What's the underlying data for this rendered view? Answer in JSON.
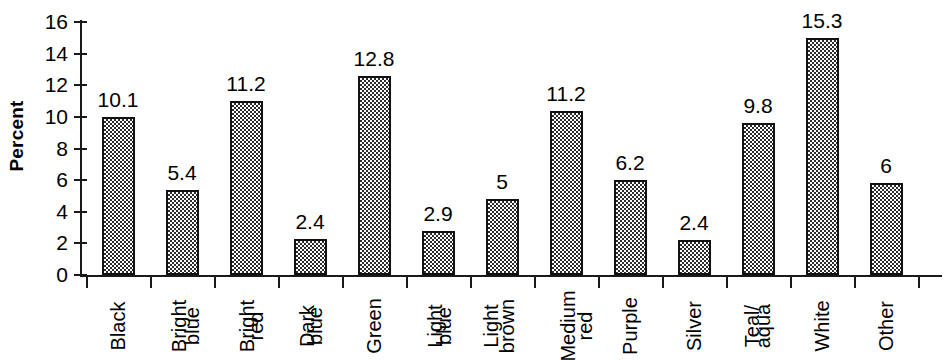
{
  "chart_data": {
    "type": "bar",
    "title": "",
    "xlabel": "",
    "ylabel": "Percent",
    "ylim": [
      0,
      16
    ],
    "ytick_step": 2,
    "yticks": [
      16,
      14,
      12,
      10,
      8,
      6,
      4,
      2,
      0
    ],
    "grid": false,
    "legend": "none",
    "orientation": "vertical",
    "bar_fill": "checkerboard-hatch",
    "bar_outline_color": "#111111",
    "categories": [
      "Black",
      "Bright blue",
      "Bright red",
      "Dark blue",
      "Green",
      "Light blue",
      "Light brown",
      "Medium red",
      "Purple",
      "Silver",
      "Teal/ aqua",
      "White",
      "Other"
    ],
    "category_label_lines": [
      [
        "Black"
      ],
      [
        "Bright",
        "blue"
      ],
      [
        "Bright",
        "red"
      ],
      [
        "Dark",
        "blue"
      ],
      [
        "Green"
      ],
      [
        "Light",
        "blue"
      ],
      [
        "Light",
        "brown"
      ],
      [
        "Medium",
        "red"
      ],
      [
        "Purple"
      ],
      [
        "Silver"
      ],
      [
        "Teal/",
        "aqua"
      ],
      [
        "White"
      ],
      [
        "Other"
      ]
    ],
    "values": [
      10.1,
      5.4,
      11.2,
      2.4,
      12.8,
      2.9,
      5,
      11.2,
      6.2,
      2.4,
      9.8,
      15.3,
      6
    ],
    "value_labels": [
      "10.1",
      "5.4",
      "11.2",
      "2.4",
      "12.8",
      "2.9",
      "5",
      "11.2",
      "6.2",
      "2.4",
      "9.8",
      "15.3",
      "6"
    ],
    "plotted_heights": [
      10.0,
      5.4,
      11.0,
      2.3,
      12.6,
      2.8,
      4.8,
      10.4,
      6.0,
      2.2,
      9.6,
      15.0,
      5.8
    ]
  }
}
